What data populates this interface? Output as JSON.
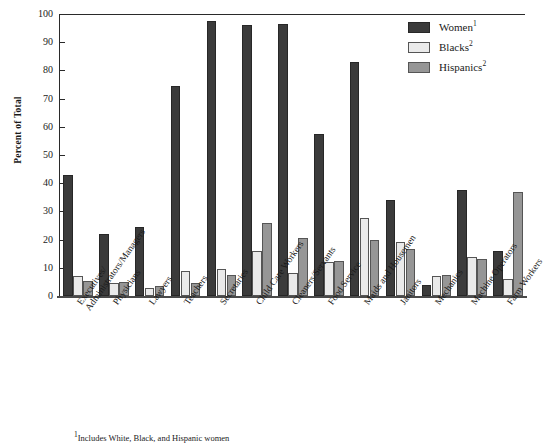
{
  "chart_data": {
    "type": "bar",
    "title": "",
    "xlabel": "",
    "ylabel": "Percent of Total",
    "ylim": [
      0,
      100
    ],
    "ytick_step": 10,
    "yticks": [
      0,
      10,
      20,
      30,
      40,
      50,
      60,
      70,
      80,
      90,
      100
    ],
    "ytick_labels": [
      "0",
      "10",
      "20",
      "30",
      "40",
      "50",
      "60",
      "70",
      "80",
      "90",
      "100"
    ],
    "grid": false,
    "legend_position": "top-right",
    "categories": [
      "Executives/\nAdministrators/Managers",
      "Physicians",
      "Lawyers",
      "Teachers",
      "Secretaries",
      "Child Care Workers",
      "Cleaners/Servants",
      "Food Service",
      "Maids and Housemen",
      "Janitors",
      "Mechanics",
      "Machine Operators",
      "Farm Workers"
    ],
    "category_lines": [
      [
        "Executives/",
        "Administrators/Managers"
      ],
      [
        "Physicians"
      ],
      [
        "Lawyers"
      ],
      [
        "Teachers"
      ],
      [
        "Secretaries"
      ],
      [
        "Child Care Workers"
      ],
      [
        "Cleaners/Servants"
      ],
      [
        "Food Service"
      ],
      [
        "Maids and Housemen"
      ],
      [
        "Janitors"
      ],
      [
        "Mechanics"
      ],
      [
        "Machine Operators"
      ],
      [
        "Farm Workers"
      ]
    ],
    "series": [
      {
        "name": "Women",
        "footnote_marker": "1",
        "color": "#3b3b3b",
        "values": [
          43,
          22,
          24.5,
          74.5,
          97.5,
          96,
          96.5,
          57.5,
          83,
          34,
          4,
          37.5,
          16
        ]
      },
      {
        "name": "Blacks",
        "footnote_marker": "2",
        "color": "#eaeaea",
        "values": [
          7,
          4.5,
          3,
          9,
          9.5,
          16,
          8,
          12,
          27.5,
          19,
          7,
          14,
          6
        ]
      },
      {
        "name": "Hispanics",
        "footnote_marker": "2",
        "color": "#969696",
        "values": [
          5.5,
          5,
          3.5,
          4.5,
          7.5,
          26,
          20.5,
          12.5,
          20,
          16.5,
          7.5,
          13,
          37
        ]
      }
    ]
  },
  "legend": {
    "items": [
      {
        "label": "Women",
        "marker": "1"
      },
      {
        "label": "Blacks",
        "marker": "2"
      },
      {
        "label": "Hispanics",
        "marker": "2"
      }
    ]
  },
  "footnote": {
    "text": "1Includes White, Black, and Hispanic women"
  }
}
